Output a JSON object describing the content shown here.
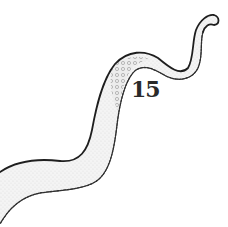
{
  "illustration": {
    "subject": "tentacle",
    "style": "pen-and-ink stipple",
    "label": "15",
    "colors": {
      "ink": "#1e1e1e",
      "fill": "#f2f2f2",
      "background": "#ffffff"
    }
  }
}
